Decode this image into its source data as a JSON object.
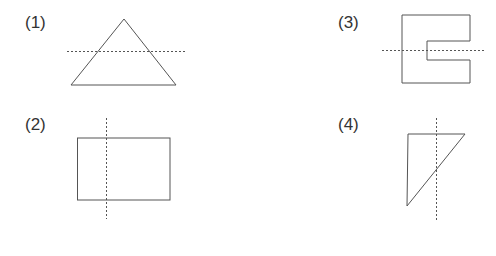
{
  "figures": [
    {
      "label": "(1)",
      "shape": "triangle",
      "axis": "horizontal dashed line"
    },
    {
      "label": "(2)",
      "shape": "rectangle",
      "axis": "vertical dashed line"
    },
    {
      "label": "(3)",
      "shape": "C-shape",
      "axis": "horizontal dashed line"
    },
    {
      "label": "(4)",
      "shape": "right triangle",
      "axis": "vertical dashed line"
    }
  ],
  "colors": {
    "stroke": "#555555",
    "dash": "#555555",
    "text": "#333333"
  }
}
